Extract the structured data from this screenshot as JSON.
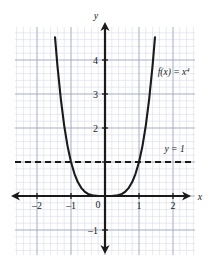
{
  "figure": {
    "kind": "cartesian-graph",
    "background": "#ffffff",
    "ink_color": "#1a1a1a",
    "minor_grid_color": "#d8dce8",
    "major_grid_color": "#9aa3bd"
  },
  "chart_data": {
    "type": "line",
    "title": "",
    "subtitle": "",
    "xlabel": "x",
    "ylabel": "y",
    "xlim": [
      -2.65,
      2.65
    ],
    "ylim": [
      -1.5,
      4.7
    ],
    "grid": true,
    "minor_grid_step": 0.2,
    "major_grid_step": 1,
    "legend_position": "inline-annotations",
    "xticks": [
      -2,
      -1,
      0,
      1,
      2
    ],
    "xtick_labels": [
      "–2",
      "–1",
      "0",
      "1",
      "2"
    ],
    "yticks": [
      -1,
      1,
      2,
      3,
      4
    ],
    "ytick_labels": [
      "–1",
      "1",
      "2",
      "3",
      "4"
    ],
    "origin_label": "0",
    "series": [
      {
        "name": "f(x) = x⁴",
        "style": "solid",
        "color": "#1a1a1a",
        "width": 2.1,
        "equation": "y = x^4",
        "x": [
          -1.47,
          -1.4,
          -1.3,
          -1.2,
          -1.1,
          -1.0,
          -0.9,
          -0.8,
          -0.7,
          -0.6,
          -0.5,
          -0.4,
          -0.3,
          -0.2,
          -0.1,
          0.0,
          0.1,
          0.2,
          0.3,
          0.4,
          0.5,
          0.6,
          0.7,
          0.8,
          0.9,
          1.0,
          1.1,
          1.2,
          1.3,
          1.4,
          1.47
        ],
        "y": [
          4.67,
          3.84,
          2.86,
          2.07,
          1.46,
          1.0,
          0.66,
          0.41,
          0.24,
          0.13,
          0.06,
          0.03,
          0.01,
          0.0016,
          0.0001,
          0.0,
          0.0001,
          0.0016,
          0.01,
          0.03,
          0.06,
          0.13,
          0.24,
          0.41,
          0.66,
          1.0,
          1.46,
          2.07,
          2.86,
          3.84,
          4.67
        ]
      },
      {
        "name": "y = 1",
        "style": "dashed",
        "color": "#1a1a1a",
        "width": 2.1,
        "equation": "y = 1",
        "constant_y": 1
      }
    ],
    "annotations": [
      {
        "id": "curve-label",
        "text": "f(x) = x",
        "exponent": "4",
        "x": 1.55,
        "y": 3.55
      },
      {
        "id": "hline-label",
        "text": "y = 1",
        "x": 1.75,
        "y": 1.28
      }
    ],
    "intersections": [
      {
        "x": -1,
        "y": 1
      },
      {
        "x": 1,
        "y": 1
      }
    ]
  }
}
